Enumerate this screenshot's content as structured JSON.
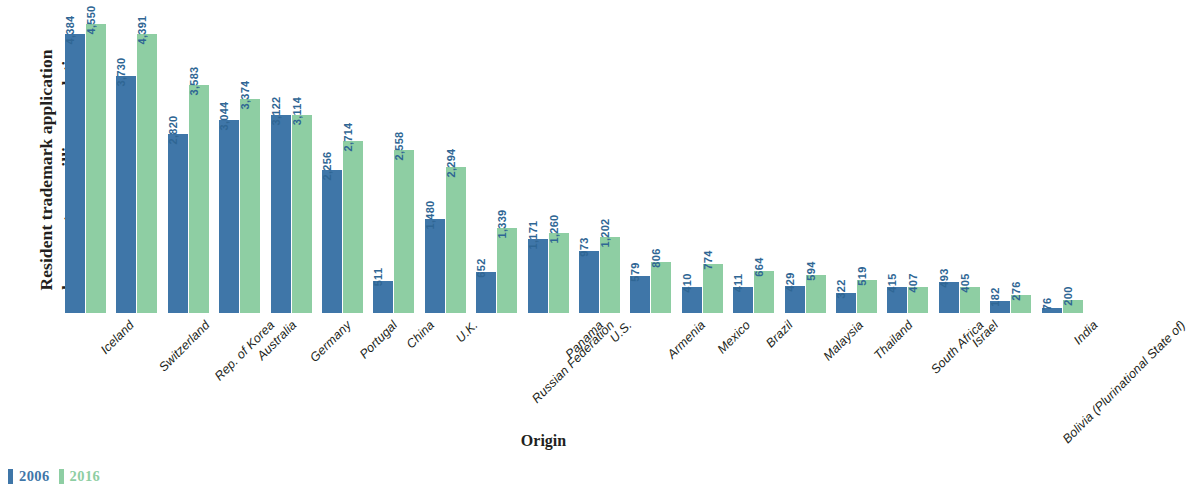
{
  "chart_data": {
    "type": "bar",
    "title": "",
    "subtitle": "",
    "ylabel": "Resident trademark application\nclass count per million population",
    "xlabel": "Origin",
    "ylim": [
      0,
      4800
    ],
    "grid": false,
    "legend_position": "bottom-left",
    "categories": [
      "Iceland",
      "Switzerland",
      "Rep. of Korea",
      "Australia",
      "Germany",
      "Portugal",
      "China",
      "U.K.",
      "Russian Federation",
      "Panama",
      "U.S.",
      "Armenia",
      "Mexico",
      "Brazil",
      "Malaysia",
      "Thailand",
      "South Africa",
      "Israel",
      "Bolivia (Plurinational State of)",
      "India"
    ],
    "series": [
      {
        "name": "2006",
        "color": "#3f76a8",
        "values": [
          4384,
          3730,
          2820,
          3044,
          3122,
          2256,
          511,
          1480,
          652,
          1171,
          973,
          579,
          410,
          411,
          429,
          322,
          415,
          493,
          182,
          76
        ],
        "labels": [
          "4,384",
          "3,730",
          "2,820",
          "3,044",
          "3,122",
          "2,256",
          "511",
          "1,480",
          "652",
          "1,171",
          "973",
          "579",
          "410",
          "411",
          "429",
          "322",
          "415",
          "493",
          "182",
          "76"
        ]
      },
      {
        "name": "2016",
        "color": "#8ecea3",
        "values": [
          4550,
          4391,
          3583,
          3374,
          3114,
          2714,
          2558,
          2294,
          1339,
          1260,
          1202,
          806,
          774,
          664,
          594,
          519,
          407,
          405,
          276,
          200
        ],
        "labels": [
          "4,550",
          "4,391",
          "3,583",
          "3,374",
          "3,114",
          "2,714",
          "2,558",
          "2,294",
          "1,339",
          "1,260",
          "1,202",
          "806",
          "774",
          "664",
          "594",
          "519",
          "407",
          "405",
          "276",
          "200"
        ]
      }
    ]
  },
  "legend": {
    "items": [
      {
        "label": "2006",
        "color": "#3f76a8"
      },
      {
        "label": "2016",
        "color": "#8ecea3"
      }
    ]
  },
  "axis": {
    "y_title": "Resident trademark application\nclass count per million population",
    "x_title": "Origin"
  }
}
